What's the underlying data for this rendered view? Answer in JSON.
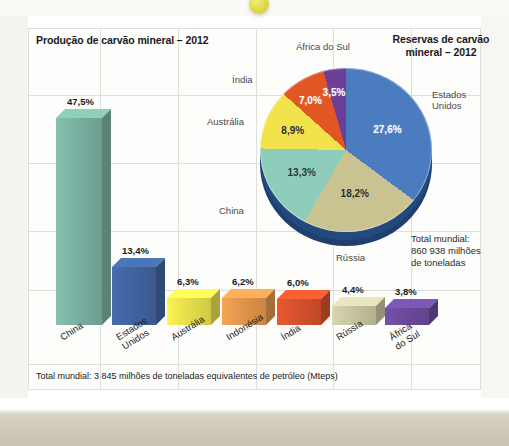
{
  "page": {
    "footer_note": "Total mundial: 3 845 milhões de toneladas equivalentes de petróleo (Mteps)"
  },
  "decoration": {
    "dot_color": "#ddd945"
  },
  "chart_data": [
    {
      "type": "bar",
      "title": "Produção de carvão mineral – 2012",
      "xlabel": "",
      "ylabel": "",
      "ylim": [
        0,
        50
      ],
      "grid": true,
      "categories": [
        "China",
        "Estados Unidos",
        "Austrália",
        "Indonésia",
        "Índia",
        "Rússia",
        "África do Sul"
      ],
      "values": [
        47.5,
        13.4,
        6.3,
        6.2,
        6.0,
        4.4,
        3.8
      ],
      "value_labels": [
        "47,5%",
        "13,4%",
        "6,3%",
        "6,2%",
        "6,0%",
        "4,4%",
        "3,8%"
      ],
      "colors": [
        "#79b0a0",
        "#41639e",
        "#e6de4c",
        "#e0954b",
        "#d4512c",
        "#c6c4a2",
        "#6b4a9b"
      ],
      "note": "Total mundial: 3 845 milhões de toneladas equivalentes de petróleo (Mteps)"
    },
    {
      "type": "pie",
      "title": "Reservas de carvão mineral – 2012",
      "labels": [
        "Estados Unidos",
        "Rússia",
        "China",
        "Austrália",
        "Índia",
        "África do Sul"
      ],
      "values": [
        27.6,
        18.2,
        13.3,
        8.9,
        7.0,
        3.5
      ],
      "value_labels": [
        "27,6%",
        "18,2%",
        "13,3%",
        "8,9%",
        "7,0%",
        "3,5%"
      ],
      "colors": [
        "#4c7cc0",
        "#c9c391",
        "#8ecdbc",
        "#f2e34d",
        "#e25624",
        "#6b3f96"
      ],
      "legend": "outside",
      "total_note": "Total mundial:\n860 938 milhões\nde toneladas",
      "total_line1": "Total mundial:",
      "total_line2": "860 938 milhões",
      "total_line3": "de toneladas"
    }
  ]
}
